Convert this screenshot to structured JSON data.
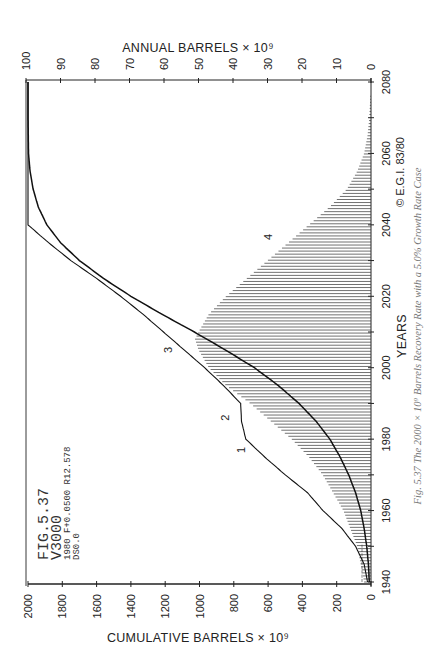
{
  "figure": {
    "id_label": "FIG.5.37",
    "run_label": "V3000",
    "params_line": "1980 F+0.0500 R12.578",
    "ds_line": "DS0.0",
    "copyright": "© E.G.I. 83/80",
    "caption": "Fig. 5.37 The 2000 × 10⁹ Barrels Recovery Rate with a 5.0% Growth Rate Case"
  },
  "axes": {
    "annual_title": "ANNUAL  BARRELS × 10⁹",
    "cumulative_title": "CUMULATIVE  BARRELS × 10⁹",
    "years_title": "YEARS"
  },
  "chart_data": {
    "type": "line",
    "title": "FIG.5.37 V3000",
    "orientation": "rotated 90° counter-clockwise (years run bottom-to-top)",
    "xlabel": "YEARS",
    "ylabel_left": "CUMULATIVE BARRELS × 10⁹",
    "ylabel_right": "ANNUAL BARRELS × 10⁹",
    "x_ticks": [
      "1940",
      "1960",
      "1980",
      "2000",
      "2020",
      "2040",
      "2060",
      "2080"
    ],
    "x_range": [
      1940,
      2080
    ],
    "cumulative_ticks": [
      "0",
      "200",
      "400",
      "600",
      "800",
      "1000",
      "1200",
      "1400",
      "1600",
      "1800",
      "2000"
    ],
    "cumulative_range": [
      0,
      2000
    ],
    "annual_ticks": [
      "0",
      "10",
      "20",
      "30",
      "40",
      "50",
      "60",
      "70",
      "80",
      "90",
      "100"
    ],
    "annual_range": [
      0,
      100
    ],
    "grid": false,
    "curve_labels": [
      "1",
      "2",
      "3",
      "4"
    ],
    "series": [
      {
        "name": "1-2-3 Cumulative discoveries / reserves additions",
        "label_points": {
          "1": 1977,
          "2": 1986,
          "3": 2005
        },
        "axis": "cumulative",
        "x": [
          1940,
          1945,
          1950,
          1955,
          1960,
          1965,
          1970,
          1975,
          1980,
          1985,
          1990,
          1995,
          2000,
          2005,
          2010,
          2015,
          2020,
          2025,
          2030,
          2035,
          2040,
          2050,
          2060,
          2080
        ],
        "values": [
          20,
          40,
          90,
          170,
          280,
          370,
          500,
          620,
          730,
          755,
          760,
          860,
          970,
          1090,
          1210,
          1330,
          1460,
          1600,
          1750,
          1880,
          2000,
          2000,
          2000,
          2000
        ]
      },
      {
        "name": "Cumulative production",
        "axis": "cumulative",
        "x": [
          1940,
          1945,
          1950,
          1955,
          1960,
          1965,
          1970,
          1975,
          1980,
          1985,
          1990,
          1995,
          2000,
          2005,
          2010,
          2015,
          2020,
          2025,
          2030,
          2035,
          2040,
          2045,
          2050,
          2055,
          2060,
          2070,
          2080
        ],
        "values": [
          10,
          15,
          25,
          40,
          60,
          90,
          130,
          180,
          240,
          320,
          420,
          540,
          680,
          850,
          1030,
          1220,
          1400,
          1560,
          1700,
          1810,
          1890,
          1940,
          1970,
          1988,
          1997,
          2000,
          2000
        ]
      },
      {
        "name": "4 Annual production (hatched)",
        "axis": "annual",
        "x": [
          1940,
          1945,
          1950,
          1955,
          1960,
          1965,
          1970,
          1975,
          1980,
          1985,
          1990,
          1995,
          2000,
          2005,
          2008,
          2010,
          2015,
          2020,
          2025,
          2030,
          2035,
          2040,
          2045,
          2050,
          2055,
          2060,
          2065,
          2070,
          2080
        ],
        "values": [
          2,
          3,
          4,
          6,
          8,
          11,
          14,
          18,
          23,
          29,
          35,
          42,
          47,
          50,
          51,
          50,
          47,
          42,
          36,
          30,
          24,
          18,
          12,
          7,
          4,
          2,
          1,
          0.5,
          0
        ]
      }
    ]
  }
}
